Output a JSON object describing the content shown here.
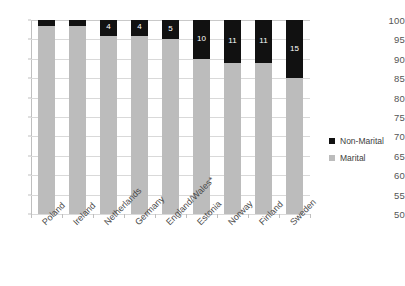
{
  "chart_data": {
    "type": "bar",
    "subtype": "stacked-bar-100",
    "title": "",
    "xlabel": "",
    "ylabel": "",
    "ylim": [
      50,
      100
    ],
    "ytick_step": 5,
    "yticks": [
      100,
      95,
      90,
      85,
      80,
      75,
      70,
      65,
      60,
      55,
      50
    ],
    "grid": true,
    "legend_position": "right",
    "categories": [
      "Poland",
      "Ireland",
      "Netherlands",
      "Germany",
      "England/Wales*",
      "Estonia",
      "Norway",
      "Finland",
      "Sweden"
    ],
    "series": [
      {
        "name": "Marital",
        "color": "#bcbcbc",
        "values": [
          98.5,
          98.5,
          96,
          96,
          95,
          90,
          89,
          89,
          85
        ],
        "labels": [
          "",
          "",
          "",
          "",
          "",
          "",
          "",
          "",
          ""
        ]
      },
      {
        "name": "Non-Marital",
        "color": "#111111",
        "values": [
          1.5,
          1.5,
          4,
          4,
          5,
          10,
          11,
          11,
          15
        ],
        "labels": [
          "",
          "",
          "4",
          "4",
          "5",
          "10",
          "11",
          "11",
          "15"
        ]
      }
    ]
  },
  "legend": {
    "items": [
      {
        "label": "Non-Marital",
        "color": "#111111"
      },
      {
        "label": "Marital",
        "color": "#bcbcbc"
      }
    ]
  }
}
